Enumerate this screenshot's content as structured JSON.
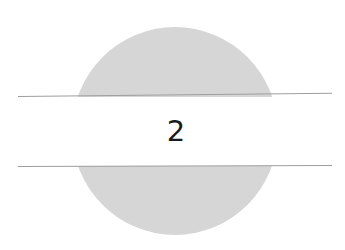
{
  "figure": {
    "label": "2",
    "colors": {
      "background": "#ffffff",
      "disc": "#d6d6d6",
      "band": "#ffffff",
      "lines": "#9e9e9e",
      "label": "#1a1a1a"
    }
  }
}
